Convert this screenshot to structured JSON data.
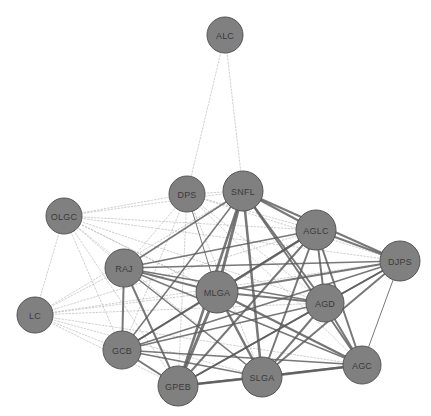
{
  "graph": {
    "title": "Network Graph",
    "width": 431,
    "height": 416,
    "background_color": "#ffffff",
    "node_fill_color": "#808080",
    "node_stroke_color": "#565656",
    "node_label_color": "#3b3b3b",
    "strong_edge_color": "#5a5a5a",
    "weak_edge_color": "#b8b8b8",
    "nodes": [
      {
        "id": "ALC",
        "label": "ALC",
        "x": 225,
        "y": 35,
        "r": 18
      },
      {
        "id": "DPS",
        "label": "DPS",
        "x": 187,
        "y": 194,
        "r": 18
      },
      {
        "id": "SNFL",
        "label": "SNFL",
        "x": 243,
        "y": 191,
        "r": 20
      },
      {
        "id": "OLGC",
        "label": "OLGC",
        "x": 64,
        "y": 216,
        "r": 18
      },
      {
        "id": "AGLC",
        "label": "AGLC",
        "x": 316,
        "y": 230,
        "r": 20
      },
      {
        "id": "DJPS",
        "label": "DJPS",
        "x": 400,
        "y": 261,
        "r": 20
      },
      {
        "id": "RAJ",
        "label": "RAJ",
        "x": 124,
        "y": 268,
        "r": 19
      },
      {
        "id": "MLGA",
        "label": "MLGA",
        "x": 217,
        "y": 292,
        "r": 21
      },
      {
        "id": "AGD",
        "label": "AGD",
        "x": 325,
        "y": 303,
        "r": 19
      },
      {
        "id": "LC",
        "label": "LC",
        "x": 35,
        "y": 315,
        "r": 18
      },
      {
        "id": "GCB",
        "label": "GCB",
        "x": 122,
        "y": 350,
        "r": 19
      },
      {
        "id": "AGC",
        "label": "AGC",
        "x": 362,
        "y": 365,
        "r": 19
      },
      {
        "id": "SLGA",
        "label": "SLGA",
        "x": 262,
        "y": 377,
        "r": 20
      },
      {
        "id": "GPEB",
        "label": "GPEB",
        "x": 178,
        "y": 386,
        "r": 20
      }
    ],
    "edges": [
      {
        "source": "ALC",
        "target": "DPS",
        "style": "dotted",
        "weight": 1
      },
      {
        "source": "ALC",
        "target": "SNFL",
        "style": "dotted",
        "weight": 1
      },
      {
        "source": "OLGC",
        "target": "LC",
        "style": "dotted",
        "weight": 1
      },
      {
        "source": "OLGC",
        "target": "DPS",
        "style": "dotted",
        "weight": 1
      },
      {
        "source": "OLGC",
        "target": "SNFL",
        "style": "dotted",
        "weight": 1
      },
      {
        "source": "OLGC",
        "target": "AGLC",
        "style": "dotted",
        "weight": 1
      },
      {
        "source": "OLGC",
        "target": "DJPS",
        "style": "dotted",
        "weight": 1
      },
      {
        "source": "OLGC",
        "target": "RAJ",
        "style": "dotted",
        "weight": 1
      },
      {
        "source": "OLGC",
        "target": "MLGA",
        "style": "dotted",
        "weight": 1
      },
      {
        "source": "OLGC",
        "target": "AGD",
        "style": "dotted",
        "weight": 1
      },
      {
        "source": "OLGC",
        "target": "GCB",
        "style": "dotted",
        "weight": 1
      },
      {
        "source": "OLGC",
        "target": "SLGA",
        "style": "dotted",
        "weight": 1
      },
      {
        "source": "OLGC",
        "target": "GPEB",
        "style": "dotted",
        "weight": 1
      },
      {
        "source": "OLGC",
        "target": "AGC",
        "style": "dotted",
        "weight": 1
      },
      {
        "source": "LC",
        "target": "RAJ",
        "style": "dotted",
        "weight": 1
      },
      {
        "source": "LC",
        "target": "MLGA",
        "style": "dotted",
        "weight": 1
      },
      {
        "source": "LC",
        "target": "AGLC",
        "style": "dotted",
        "weight": 1
      },
      {
        "source": "LC",
        "target": "DJPS",
        "style": "dotted",
        "weight": 1
      },
      {
        "source": "LC",
        "target": "AGD",
        "style": "dotted",
        "weight": 1
      },
      {
        "source": "LC",
        "target": "GCB",
        "style": "dotted",
        "weight": 1
      },
      {
        "source": "LC",
        "target": "SLGA",
        "style": "dotted",
        "weight": 1
      },
      {
        "source": "LC",
        "target": "GPEB",
        "style": "dotted",
        "weight": 1
      },
      {
        "source": "LC",
        "target": "AGC",
        "style": "dotted",
        "weight": 1
      },
      {
        "source": "LC",
        "target": "SNFL",
        "style": "dotted",
        "weight": 1
      },
      {
        "source": "DPS",
        "target": "SNFL",
        "style": "dotted",
        "weight": 1
      },
      {
        "source": "DPS",
        "target": "AGLC",
        "style": "dotted",
        "weight": 1
      },
      {
        "source": "DPS",
        "target": "DJPS",
        "style": "dotted",
        "weight": 1
      },
      {
        "source": "DPS",
        "target": "RAJ",
        "style": "dotted",
        "weight": 1
      },
      {
        "source": "DPS",
        "target": "MLGA",
        "style": "solid",
        "weight": 1
      },
      {
        "source": "DPS",
        "target": "AGD",
        "style": "dotted",
        "weight": 1
      },
      {
        "source": "DPS",
        "target": "GCB",
        "style": "dotted",
        "weight": 1
      },
      {
        "source": "DPS",
        "target": "SLGA",
        "style": "dotted",
        "weight": 1
      },
      {
        "source": "DPS",
        "target": "GPEB",
        "style": "dotted",
        "weight": 1
      },
      {
        "source": "DPS",
        "target": "AGC",
        "style": "dotted",
        "weight": 1
      },
      {
        "source": "SNFL",
        "target": "AGLC",
        "style": "solid",
        "weight": 2
      },
      {
        "source": "SNFL",
        "target": "DJPS",
        "style": "solid",
        "weight": 2
      },
      {
        "source": "SNFL",
        "target": "RAJ",
        "style": "solid",
        "weight": 1.5
      },
      {
        "source": "SNFL",
        "target": "MLGA",
        "style": "solid",
        "weight": 3
      },
      {
        "source": "SNFL",
        "target": "AGD",
        "style": "solid",
        "weight": 2
      },
      {
        "source": "SNFL",
        "target": "GCB",
        "style": "solid",
        "weight": 1.5
      },
      {
        "source": "SNFL",
        "target": "SLGA",
        "style": "solid",
        "weight": 2.5
      },
      {
        "source": "SNFL",
        "target": "GPEB",
        "style": "solid",
        "weight": 2.5
      },
      {
        "source": "SNFL",
        "target": "AGC",
        "style": "solid",
        "weight": 2
      },
      {
        "source": "AGLC",
        "target": "DJPS",
        "style": "solid",
        "weight": 2
      },
      {
        "source": "AGLC",
        "target": "RAJ",
        "style": "solid",
        "weight": 1.5
      },
      {
        "source": "AGLC",
        "target": "MLGA",
        "style": "solid",
        "weight": 2.5
      },
      {
        "source": "AGLC",
        "target": "AGD",
        "style": "solid",
        "weight": 2
      },
      {
        "source": "AGLC",
        "target": "GCB",
        "style": "solid",
        "weight": 1.5
      },
      {
        "source": "AGLC",
        "target": "SLGA",
        "style": "solid",
        "weight": 2
      },
      {
        "source": "AGLC",
        "target": "GPEB",
        "style": "solid",
        "weight": 2
      },
      {
        "source": "AGLC",
        "target": "AGC",
        "style": "solid",
        "weight": 2
      },
      {
        "source": "DJPS",
        "target": "RAJ",
        "style": "solid",
        "weight": 1.5
      },
      {
        "source": "DJPS",
        "target": "MLGA",
        "style": "solid",
        "weight": 2
      },
      {
        "source": "DJPS",
        "target": "AGD",
        "style": "solid",
        "weight": 1.5
      },
      {
        "source": "DJPS",
        "target": "GCB",
        "style": "solid",
        "weight": 1.5
      },
      {
        "source": "DJPS",
        "target": "SLGA",
        "style": "solid",
        "weight": 2
      },
      {
        "source": "DJPS",
        "target": "GPEB",
        "style": "solid",
        "weight": 1.5
      },
      {
        "source": "DJPS",
        "target": "AGC",
        "style": "solid",
        "weight": 1
      },
      {
        "source": "RAJ",
        "target": "MLGA",
        "style": "solid",
        "weight": 2
      },
      {
        "source": "RAJ",
        "target": "AGD",
        "style": "solid",
        "weight": 1.5
      },
      {
        "source": "RAJ",
        "target": "GCB",
        "style": "solid",
        "weight": 2
      },
      {
        "source": "RAJ",
        "target": "SLGA",
        "style": "solid",
        "weight": 1.5
      },
      {
        "source": "RAJ",
        "target": "GPEB",
        "style": "solid",
        "weight": 2
      },
      {
        "source": "RAJ",
        "target": "AGC",
        "style": "solid",
        "weight": 1.5
      },
      {
        "source": "MLGA",
        "target": "AGD",
        "style": "solid",
        "weight": 2
      },
      {
        "source": "MLGA",
        "target": "GCB",
        "style": "solid",
        "weight": 2
      },
      {
        "source": "MLGA",
        "target": "SLGA",
        "style": "solid",
        "weight": 2.5
      },
      {
        "source": "MLGA",
        "target": "GPEB",
        "style": "solid",
        "weight": 3
      },
      {
        "source": "MLGA",
        "target": "AGC",
        "style": "solid",
        "weight": 2.5
      },
      {
        "source": "AGD",
        "target": "GCB",
        "style": "solid",
        "weight": 1.5
      },
      {
        "source": "AGD",
        "target": "SLGA",
        "style": "solid",
        "weight": 2
      },
      {
        "source": "AGD",
        "target": "GPEB",
        "style": "solid",
        "weight": 2
      },
      {
        "source": "AGD",
        "target": "AGC",
        "style": "solid",
        "weight": 2
      },
      {
        "source": "GCB",
        "target": "SLGA",
        "style": "solid",
        "weight": 1.5
      },
      {
        "source": "GCB",
        "target": "GPEB",
        "style": "solid",
        "weight": 2
      },
      {
        "source": "GCB",
        "target": "AGC",
        "style": "solid",
        "weight": 1.5
      },
      {
        "source": "SLGA",
        "target": "GPEB",
        "style": "solid",
        "weight": 2.5
      },
      {
        "source": "SLGA",
        "target": "AGC",
        "style": "solid",
        "weight": 2.5
      },
      {
        "source": "GPEB",
        "target": "AGC",
        "style": "solid",
        "weight": 2
      }
    ]
  }
}
